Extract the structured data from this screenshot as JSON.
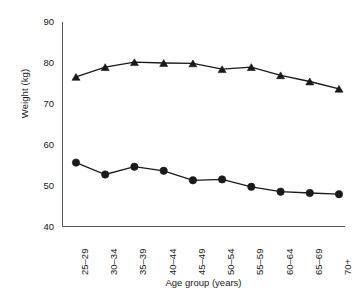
{
  "chart_data": {
    "type": "line",
    "title": "",
    "xlabel": "Age group (years)",
    "ylabel": "Weight (kg)",
    "categories": [
      "25–29",
      "30–34",
      "35–39",
      "40–44",
      "45–49",
      "50–54",
      "55–59",
      "60–64",
      "65–69",
      "70+"
    ],
    "ylim": [
      40,
      90
    ],
    "yticks": [
      40,
      50,
      60,
      70,
      80,
      90
    ],
    "grid": false,
    "legend": "none",
    "series": [
      {
        "name": "Men",
        "marker": "triangle",
        "color": "#1a1a1a",
        "values": [
          76.6,
          79.0,
          80.2,
          80.0,
          79.9,
          78.5,
          79.0,
          77.0,
          75.5,
          73.7
        ]
      },
      {
        "name": "Women",
        "marker": "circle",
        "color": "#1a1a1a",
        "values": [
          55.7,
          52.8,
          54.7,
          53.7,
          51.4,
          51.6,
          49.8,
          48.6,
          48.3,
          48.0
        ]
      }
    ]
  },
  "axis": {
    "line_color": "#555555",
    "tick_color": "#555555"
  }
}
